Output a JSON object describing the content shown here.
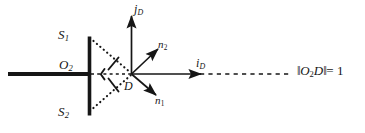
{
  "figure": {
    "background_color": "#ffffff",
    "ink_color": "#161616",
    "width": 365,
    "height": 133,
    "labels": {
      "slit_upper": "S",
      "slit_upper_sub": "1",
      "slit_lower": "S",
      "slit_lower_sub": "2",
      "origin": "O",
      "origin_sub": "2",
      "detector_point": "D",
      "axis_vertical": "j",
      "axis_vertical_sub": "D",
      "axis_horizontal": "i",
      "axis_horizontal_sub": "D",
      "normal_upper": "n",
      "normal_upper_sub": "2",
      "normal_lower": "n",
      "normal_lower_sub": "1",
      "distance_equation_lead": "‖",
      "distance_equation_o": "O",
      "distance_equation_o_sub": "2",
      "distance_equation_d": "D",
      "distance_equation_bar": "‖",
      "distance_equation_tail": "= 1"
    },
    "elements": {
      "screen_barrier": "vertical-barrier",
      "optical_axis": "horizontal-thick-ray",
      "ray_s1_to_d": "dotted-ray-upper",
      "ray_s2_to_d": "dotted-ray-lower",
      "axis_from_o2_to_d": "dashed-axis-segment",
      "unit_distance_line": "dashed-unit-length-line",
      "angle_marker_upper": "angle-arc-upper",
      "angle_marker_lower": "angle-arc-lower"
    }
  }
}
